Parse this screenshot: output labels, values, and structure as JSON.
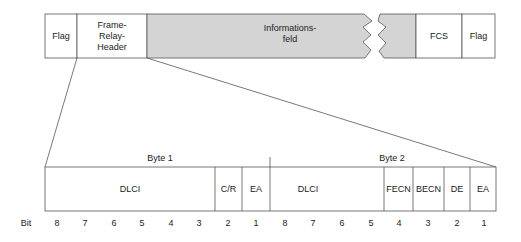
{
  "frame": {
    "flag_start": "Flag",
    "header": [
      "Frame-",
      "Relay-",
      "Header"
    ],
    "info": [
      "Informations-",
      "feld"
    ],
    "fcs": "FCS",
    "flag_end": "Flag"
  },
  "header_detail": {
    "byte1_label": "Byte 1",
    "byte2_label": "Byte 2",
    "fields": [
      {
        "label": "DLCI",
        "x1": 45,
        "x2": 215
      },
      {
        "label": "C/R",
        "x1": 215,
        "x2": 242
      },
      {
        "label": "EA",
        "x1": 242,
        "x2": 270
      },
      {
        "label": "DLCI",
        "x1": 270,
        "x2": 384
      },
      {
        "label": "FECN",
        "x1": 384,
        "x2": 413
      },
      {
        "label": "BECN",
        "x1": 413,
        "x2": 444
      },
      {
        "label": "DE",
        "x1": 444,
        "x2": 470
      },
      {
        "label": "EA",
        "x1": 470,
        "x2": 496
      }
    ],
    "bit_label": "Bit",
    "bits": [
      "8",
      "7",
      "6",
      "5",
      "4",
      "3",
      "2",
      "1",
      "8",
      "7",
      "6",
      "5",
      "4",
      "3",
      "2",
      "1"
    ]
  },
  "colors": {
    "line": "#555555",
    "info_fill": "#d4d4d4"
  }
}
